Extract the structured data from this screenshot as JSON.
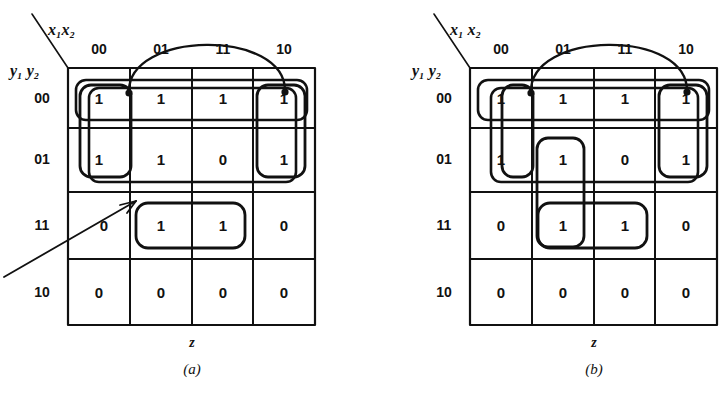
{
  "figure": {
    "kind": "karnaugh-map-pair",
    "maps": [
      {
        "id": "a",
        "caption": "(a)",
        "column_variables": "x₁x₂",
        "row_variables": "y₁ y₂",
        "output_label": "z",
        "column_headers": [
          "00",
          "01",
          "11",
          "10"
        ],
        "row_headers": [
          "00",
          "01",
          "11",
          "10"
        ],
        "cells": [
          [
            "1",
            "1",
            "1",
            "1"
          ],
          [
            "1",
            "1",
            "0",
            "1"
          ],
          [
            "0",
            "1",
            "1",
            "0"
          ],
          [
            "0",
            "0",
            "0",
            "0"
          ]
        ],
        "groups": [
          {
            "name": "wrap-around-group-row00",
            "cells": "row 00 all columns (wrap)"
          },
          {
            "name": "wrap-around-group-col00-col10",
            "cells": "rows 00-01, columns 00 and 10 (wrap)"
          },
          {
            "name": "group-col00-rows00-01",
            "cells": "rows 00-01, column 00"
          },
          {
            "name": "group-col10-rows00-01",
            "cells": "rows 00-01, column 10"
          },
          {
            "name": "group-row11-col01-11",
            "cells": "row 11, columns 01 and 11"
          }
        ],
        "annotations": [
          {
            "name": "wrap-arc",
            "from": "column 00 top",
            "to": "column 10 top"
          },
          {
            "name": "pointer-arrow",
            "points_to": "row 11 column 01 region"
          }
        ]
      },
      {
        "id": "b",
        "caption": "(b)",
        "column_variables": "x₁ x₂",
        "row_variables": "y₁ y₂",
        "output_label": "z",
        "column_headers": [
          "00",
          "01",
          "11",
          "10"
        ],
        "row_headers": [
          "00",
          "01",
          "11",
          "10"
        ],
        "cells": [
          [
            "1",
            "1",
            "1",
            "1"
          ],
          [
            "1",
            "1",
            "0",
            "1"
          ],
          [
            "0",
            "1",
            "1",
            "0"
          ],
          [
            "0",
            "0",
            "0",
            "0"
          ]
        ],
        "groups": [
          {
            "name": "wrap-around-group-row00",
            "cells": "row 00 all columns (wrap)"
          },
          {
            "name": "wrap-around-group-col00-col10",
            "cells": "rows 00-01, columns 00 and 10 (wrap)"
          },
          {
            "name": "group-col00-rows00-01",
            "cells": "rows 00-01, column 00"
          },
          {
            "name": "group-col10-rows00-01",
            "cells": "rows 00-01, column 10"
          },
          {
            "name": "group-col01-rows01-11",
            "cells": "rows 01 and 11, column 01"
          },
          {
            "name": "group-row11-col01-11",
            "cells": "row 11, columns 01 and 11"
          }
        ],
        "annotations": [
          {
            "name": "wrap-arc",
            "from": "column 00 top",
            "to": "column 10 top"
          }
        ]
      }
    ]
  },
  "style": {
    "ink": "#111111",
    "paper": "#ffffff"
  }
}
